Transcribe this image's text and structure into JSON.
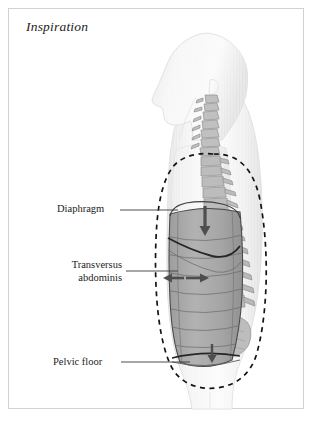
{
  "figure": {
    "title": "Inspiration",
    "domain_subject": "respiratory-anatomy-sagittal-diagram",
    "background_color": "#ffffff",
    "frame_color": "#d2d2d2",
    "body_fill_color": "#f2f2f2",
    "body_outline_color": "#dcdcdc",
    "cavity_fill_color": "#a9a9a9",
    "cavity_outline_color": "#4a4a4a",
    "spine_color": "#b6b6b6",
    "spine_outline_color": "#8d8d8d",
    "dashed_outline_color": "#141414",
    "arrow_color": "#555555",
    "leader_line_color": "#3a3a3a",
    "text_color": "#1c1c1c"
  },
  "labels": {
    "diaphragm": "Diaphragm",
    "transversus_abdominis": "Transversus\nabdominis",
    "pelvic_floor": "Pelvic floor"
  },
  "annotations": {
    "diaphragm_motion": "downward",
    "transversus_motion": "outward-and-inward",
    "pelvic_floor_motion": "downward",
    "dashed_outline_meaning": "expanded-abdominal-cavity-outline"
  },
  "figure_elements": {
    "head_profile": "left-facing-head-silhouette",
    "cervical_spine": "cervical-vertebrae",
    "thoracic_spine": "thoracic-vertebrae",
    "lumbar_spine": "lumbar-vertebrae",
    "sacrum": "sacrum",
    "lung_region": "thoracic-cavity",
    "abdominal_cavity": "abdominal-cavity"
  }
}
